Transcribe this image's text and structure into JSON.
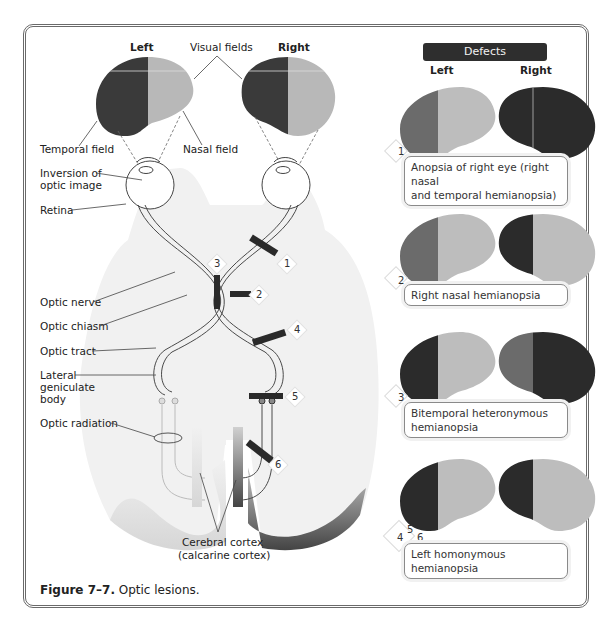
{
  "figure": {
    "caption_label": "Figure 7–7.",
    "caption_text": " Optic lesions."
  },
  "visual_fields": {
    "title": "Visual fields",
    "left_label": "Left",
    "right_label": "Right",
    "temporal_label": "Temporal field",
    "nasal_label": "Nasal field"
  },
  "anatomy_labels": {
    "inversion": [
      "Inversion of",
      "optic image"
    ],
    "retina": "Retina",
    "optic_nerve": "Optic nerve",
    "optic_chiasm": "Optic chiasm",
    "optic_tract": "Optic tract",
    "lateral_geniculate": [
      "Lateral",
      "geniculate",
      "body"
    ],
    "optic_radiation": "Optic radiation",
    "cortex": [
      "Cerebral cortex",
      "(calcarine cortex)"
    ]
  },
  "lesion_markers": [
    "1",
    "2",
    "3",
    "4",
    "5",
    "6"
  ],
  "defects": {
    "header": "Defects",
    "left_label": "Left",
    "right_label": "Right",
    "items": [
      {
        "number": "1",
        "label_lines": [
          "Anopsia of right eye (right nasal",
          "and temporal hemianopsia)"
        ]
      },
      {
        "number": "2",
        "label_lines": [
          "Right nasal hemianopsia"
        ]
      },
      {
        "number": "3",
        "label_lines": [
          "Bitemporal heteronymous",
          "hemianopsia"
        ]
      },
      {
        "number_lines": [
          "4",
          "5",
          "6"
        ],
        "label_lines": [
          "Left homonymous hemianopsia"
        ]
      }
    ]
  },
  "colors": {
    "dark": "#2b2b2b",
    "medium": "#6b6b6b",
    "light": "#bdbdbd",
    "brain": "#f1f1f1",
    "cortex_light": "#d6d6d6",
    "cortex_dark": "#444444"
  }
}
